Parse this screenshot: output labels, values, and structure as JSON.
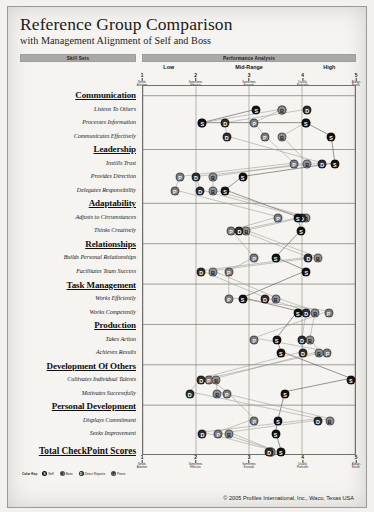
{
  "report": {
    "title": "Reference Group Comparison",
    "subtitle": "with Management Alignment of Self and Boss",
    "band_skill": "Skill Sets",
    "band_performance": "Performance Analysis",
    "total_label": "Total CheckPoint Scores",
    "copyright": "© 2005 Profiles International, Inc., Waco, Texas USA"
  },
  "legend": {
    "key_label": "Color Key:",
    "items": [
      {
        "code": "S",
        "name": "Self",
        "color": "#121212"
      },
      {
        "code": "B",
        "name": "Boss",
        "color": "#8f8f8f"
      },
      {
        "code": "D",
        "name": "Direct Reports",
        "color": "#2e2e2e"
      },
      {
        "code": "P",
        "name": "Peers",
        "color": "#7b7b7b"
      }
    ]
  },
  "chart_data": {
    "type": "scatter",
    "title": "Reference Group Comparison",
    "subtitle": "with Management Alignment of Self and Boss",
    "xlabel": "Performance Analysis",
    "ylabel": "Skill Sets",
    "xlim": [
      1,
      5
    ],
    "grid": true,
    "legend_position": "bottom-left",
    "zones": [
      {
        "label": "Low",
        "center": 1.5
      },
      {
        "label": "Mid-Range",
        "center": 3.0
      },
      {
        "label": "High",
        "center": 4.5
      }
    ],
    "ticks": [
      {
        "value": 1,
        "num": "1",
        "label": "Needs\nAttention"
      },
      {
        "value": 2,
        "num": "2",
        "label": "Sometimes\nEffective"
      },
      {
        "value": 3,
        "num": "3",
        "label": "Sometimes\nExceeds"
      },
      {
        "value": 4,
        "num": "4",
        "label": "Usually\nProficient"
      },
      {
        "value": 5,
        "num": "5",
        "label": "Always\nExcels"
      }
    ],
    "series": [
      {
        "name": "Self",
        "code": "S",
        "color": "#121212"
      },
      {
        "name": "Boss",
        "code": "B",
        "color": "#8f8f8f"
      },
      {
        "name": "Direct Reports",
        "code": "D",
        "color": "#2e2e2e"
      },
      {
        "name": "Peers",
        "code": "P",
        "color": "#7b7b7b"
      }
    ],
    "categories": [
      {
        "name": "Communication",
        "items": [
          {
            "label": "Listens To Others",
            "S": 3.14,
            "B": 3.62,
            "D": 4.1,
            "P": 3.62
          },
          {
            "label": "Processes Information",
            "S": 2.12,
            "B": 2.12,
            "D": 2.55,
            "P": 3.1,
            "extra": [
              {
                "code": "S",
                "x": 4.07
              },
              {
                "code": "B",
                "x": 4.07
              }
            ]
          },
          {
            "label": "Communicates Effectively",
            "S": 4.55,
            "B": 3.62,
            "D": 2.58,
            "P": 3.3
          }
        ]
      },
      {
        "name": "Leadership",
        "items": [
          {
            "label": "Instills Trust",
            "S": 4.62,
            "B": 4.1,
            "D": 4.38,
            "P": 3.85
          },
          {
            "label": "Provides Direction",
            "S": 2.88,
            "B": 2.32,
            "D": 2.0,
            "P": 1.7
          },
          {
            "label": "Delegates Responsibility",
            "S": 2.55,
            "B": 2.32,
            "D": 2.08,
            "P": 1.6
          }
        ]
      },
      {
        "name": "Adaptability",
        "items": [
          {
            "label": "Adjusts to Circumstances",
            "S": 3.92,
            "B": 4.08,
            "D": 4.0,
            "P": 3.55
          },
          {
            "label": "Thinks Creatively",
            "S": 3.98,
            "B": 2.95,
            "D": 2.82,
            "P": 2.66
          }
        ]
      },
      {
        "name": "Relationships",
        "items": [
          {
            "label": "Builds Personal Relationships",
            "S": 3.5,
            "B": 4.3,
            "D": 4.12,
            "P": 3.1
          },
          {
            "label": "Facilitates Team Success",
            "S": 4.08,
            "B": 2.32,
            "D": 2.1,
            "P": 2.62
          }
        ]
      },
      {
        "name": "Task Management",
        "items": [
          {
            "label": "Works Efficiently",
            "S": 2.88,
            "B": 3.5,
            "D": 3.3,
            "P": 2.62
          },
          {
            "label": "Works Competently",
            "S": 3.92,
            "B": 4.25,
            "D": 4.08,
            "P": 4.5
          }
        ]
      },
      {
        "name": "Production",
        "items": [
          {
            "label": "Takes Action",
            "S": 3.52,
            "B": 4.15,
            "D": 4.0,
            "P": 3.1
          },
          {
            "label": "Achieves Results",
            "S": 3.6,
            "B": 4.32,
            "D": 4.02,
            "P": 4.48
          }
        ]
      },
      {
        "name": "Development Of Others",
        "items": [
          {
            "label": "Cultivates Individual Talents",
            "S": 4.92,
            "B": 2.38,
            "D": 2.1,
            "P": 2.24
          },
          {
            "label": "Motivates Successfully",
            "S": 3.68,
            "B": 2.4,
            "D": 1.88,
            "P": 2.58
          }
        ]
      },
      {
        "name": "Personal Development",
        "items": [
          {
            "label": "Displays Commitment",
            "S": 3.55,
            "B": 4.52,
            "D": 4.3,
            "P": 3.1
          },
          {
            "label": "Seeks Improvement",
            "S": 3.5,
            "B": 2.62,
            "D": 2.12,
            "P": 2.42
          }
        ]
      }
    ],
    "total": {
      "label": "Total CheckPoint Scores",
      "S": 3.6,
      "B": 3.42,
      "D": 3.38,
      "P": 3.42
    }
  }
}
